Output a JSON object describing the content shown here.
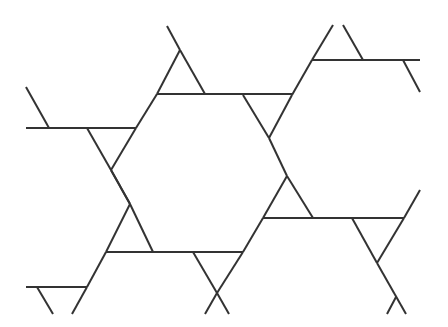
{
  "figure": {
    "width": 448,
    "height": 327,
    "stroke_color": "#333333",
    "background": "#ffffff",
    "stroke_width": 2,
    "lines": [
      [
        26,
        87,
        49,
        128
      ],
      [
        26,
        128,
        136,
        128
      ],
      [
        87,
        128,
        111,
        170
      ],
      [
        136,
        128,
        111,
        170
      ],
      [
        111,
        170,
        130,
        204
      ],
      [
        136,
        128,
        157,
        94
      ],
      [
        167,
        26,
        180,
        50
      ],
      [
        180,
        50,
        205,
        94
      ],
      [
        157,
        94,
        180,
        50
      ],
      [
        157,
        94,
        293,
        94
      ],
      [
        243,
        95,
        269,
        138
      ],
      [
        292,
        95,
        269,
        138
      ],
      [
        292,
        95,
        312,
        60
      ],
      [
        312,
        60,
        333,
        25
      ],
      [
        343,
        25,
        363,
        60
      ],
      [
        312,
        60,
        420,
        60
      ],
      [
        403,
        60,
        420,
        92
      ],
      [
        269,
        138,
        287,
        176
      ],
      [
        287,
        176,
        313,
        218
      ],
      [
        263,
        218,
        287,
        176
      ],
      [
        263,
        218,
        404,
        218
      ],
      [
        111,
        170,
        130,
        204
      ],
      [
        130,
        204,
        153,
        252
      ],
      [
        130,
        204,
        106,
        252
      ],
      [
        106,
        252,
        243,
        252
      ],
      [
        193,
        252,
        217,
        293
      ],
      [
        243,
        252,
        217,
        293
      ],
      [
        217,
        293,
        229,
        314
      ],
      [
        243,
        252,
        263,
        218
      ],
      [
        217,
        293,
        205,
        314
      ],
      [
        106,
        252,
        87,
        287
      ],
      [
        26,
        287,
        87,
        287
      ],
      [
        37,
        287,
        53,
        314
      ],
      [
        87,
        287,
        72,
        314
      ],
      [
        352,
        218,
        377,
        263
      ],
      [
        404,
        218,
        377,
        263
      ],
      [
        404,
        218,
        420,
        190
      ],
      [
        377,
        263,
        406,
        314
      ],
      [
        396,
        297,
        387,
        314
      ]
    ]
  }
}
